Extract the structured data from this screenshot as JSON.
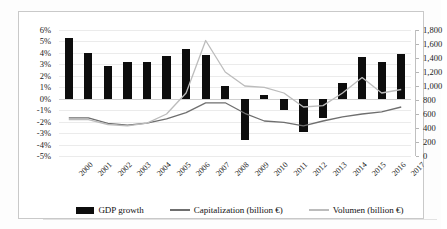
{
  "chart_data": {
    "type": "bar",
    "title": "",
    "subtitle": "",
    "xlabel": "",
    "ylabel": "",
    "y2label": "",
    "grid": true,
    "legend_position": "bottom",
    "categories": [
      "2000",
      "2001",
      "2002",
      "2003",
      "2004",
      "2005",
      "2006",
      "2007",
      "2008",
      "2009",
      "2010",
      "2011",
      "2012",
      "2013",
      "2014",
      "2015",
      "2016",
      "2017"
    ],
    "axes": {
      "left": {
        "label": "",
        "ylim": [
          -5,
          6
        ],
        "ticks": [
          6,
          5,
          4,
          3,
          2,
          1,
          0,
          -1,
          -2,
          -3,
          -4,
          -5
        ],
        "tick_labels": [
          "6%",
          "5%",
          "4%",
          "3%",
          "2%",
          "1%",
          "0%",
          "-1%",
          "-2%",
          "-3%",
          "-4%",
          "-5%"
        ],
        "unit": "%"
      },
      "right": {
        "label": "",
        "ylim": [
          0,
          1800
        ],
        "ticks": [
          1800,
          1600,
          1400,
          1200,
          1000,
          800,
          600,
          400,
          200,
          0
        ],
        "tick_labels": [
          "1,800",
          "1,600",
          "1,400",
          "1,200",
          "1,000",
          "800",
          "600",
          "400",
          "200",
          "0"
        ],
        "unit": "billion €"
      }
    },
    "series": [
      {
        "name": "GDP growth",
        "type": "bar",
        "axis": "left",
        "color": "#0d0d0d",
        "unit": "%",
        "values": [
          5.3,
          4.0,
          2.9,
          3.2,
          3.2,
          3.7,
          4.3,
          3.8,
          1.1,
          -3.6,
          0.3,
          -1.0,
          -2.9,
          -1.7,
          1.4,
          3.6,
          3.2,
          3.9
        ]
      },
      {
        "name": "Capitalization (billion €)",
        "type": "line",
        "axis": "right",
        "color": "#6f6f6f",
        "unit": "billion €",
        "values": [
          545,
          545,
          465,
          440,
          470,
          530,
          620,
          760,
          760,
          610,
          500,
          480,
          430,
          500,
          560,
          600,
          630,
          700
        ]
      },
      {
        "name": "Volumen (billion €)",
        "type": "line",
        "axis": "right",
        "color": "#bcbcbc",
        "unit": "billion €",
        "values": [
          520,
          520,
          450,
          430,
          470,
          600,
          900,
          1650,
          1200,
          1000,
          980,
          900,
          700,
          720,
          900,
          1120,
          900,
          950
        ]
      }
    ]
  },
  "legend": {
    "items": [
      {
        "label": "GDP growth",
        "marker": "bar",
        "color": "#0d0d0d"
      },
      {
        "label": "Capitalization (billion €)",
        "marker": "line",
        "color": "#6f6f6f"
      },
      {
        "label": "Volumen (billion €)",
        "marker": "line",
        "color": "#bcbcbc"
      }
    ]
  }
}
